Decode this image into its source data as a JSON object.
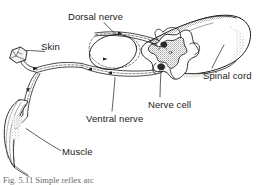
{
  "figure": {
    "caption": "Fig. 5.11 Simple reflex arc",
    "background_color": "#ffffff",
    "ink_color": "#1a1a1a",
    "stipple_color": "#6e6e6e"
  },
  "labels": {
    "dorsal_nerve": "Dorsal nerve",
    "skin": "Skin",
    "spinal_cord": "Spinal cord",
    "nerve_cell": "Nerve cell",
    "ventral_nerve": "Ventral nerve",
    "muscle": "Muscle"
  },
  "structures": [
    {
      "name": "spinal-cord",
      "label": "Spinal cord",
      "description": "Cut cylinder of spinal cord shown in perspective with rounded distal end and stippled shading"
    },
    {
      "name": "gray-matter",
      "label": "",
      "description": "Butterfly shaped gray matter in cross-section, stippled"
    },
    {
      "name": "dorsal-root-ganglion",
      "label": "",
      "description": "Oval swelling on the dorsal root"
    },
    {
      "name": "dorsal-nerve",
      "label": "Dorsal nerve",
      "description": "Sensory root entering the dorsal horn of the spinal cord"
    },
    {
      "name": "ventral-nerve",
      "label": "Ventral nerve",
      "description": "Motor root leaving the ventral horn of the spinal cord"
    },
    {
      "name": "nerve-cell",
      "label": "Nerve cell",
      "description": "Motor neuron cell body in the ventral horn gray matter"
    },
    {
      "name": "skin-receptor",
      "label": "Skin",
      "description": "Small stippled block of skin containing the sensory receptor"
    },
    {
      "name": "muscle",
      "label": "Muscle",
      "description": "Elongated spindle-shaped striated muscle, the effector"
    }
  ]
}
